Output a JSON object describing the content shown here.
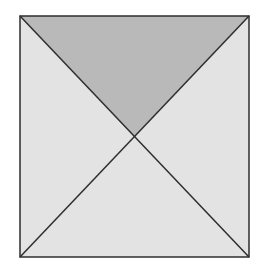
{
  "diagram": {
    "type": "square-divided-by-diagonals",
    "square": {
      "x1": 20,
      "y1": 16,
      "x2": 249,
      "y2": 257
    },
    "center": {
      "x": 134,
      "y": 137
    },
    "regions": [
      {
        "name": "top-triangle",
        "shaded": true
      },
      {
        "name": "left-triangle",
        "shaded": false
      },
      {
        "name": "right-triangle",
        "shaded": false
      },
      {
        "name": "bottom-triangle",
        "shaded": false
      }
    ],
    "colors": {
      "shaded": "#b9b9b9",
      "light": "#e3e3e3",
      "stroke": "#2e2e2e",
      "background": "#ffffff"
    }
  }
}
